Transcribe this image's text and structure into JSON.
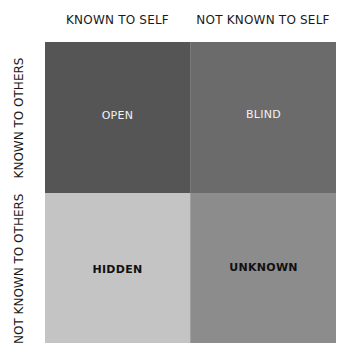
{
  "diagram": {
    "type": "johari-window",
    "column_headers": [
      "KNOWN TO SELF",
      "NOT KNOWN TO SELF"
    ],
    "row_headers": [
      "KNOWN TO OTHERS",
      "NOT KNOWN TO OTHERS"
    ],
    "quadrants": [
      {
        "label": "OPEN",
        "color": "#555555",
        "text_color": "#f2f2f2"
      },
      {
        "label": "BLIND",
        "color": "#6b6b6b",
        "text_color": "#f2f2f2"
      },
      {
        "label": "HIDDEN",
        "color": "#c4c4c4",
        "text_color": "#111111"
      },
      {
        "label": "UNKNOWN",
        "color": "#8c8c8c",
        "text_color": "#111111"
      }
    ]
  }
}
